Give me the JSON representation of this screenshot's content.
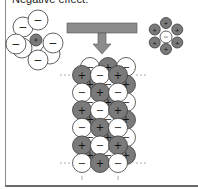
{
  "caption": "Negative effect:",
  "colors": {
    "cation_fill": "#7a7a7a",
    "anion_fill": "#ffffff",
    "outline": "#3a3a3a",
    "arrow_fill": "#8c8c8c",
    "border": "#8a8a8a"
  },
  "symbols": {
    "cation": "+",
    "anion": "−"
  },
  "left_cluster": {
    "label": "hydrated cation",
    "center": "cation",
    "surrounding": [
      "anion",
      "anion",
      "anion",
      "anion",
      "anion"
    ]
  },
  "right_cluster": {
    "label": "hydrated anion",
    "center": "anion",
    "surrounding": [
      "cation",
      "cation",
      "cation",
      "cation",
      "cation",
      "cation"
    ]
  },
  "arrow": {
    "direction": "down",
    "label": ""
  },
  "lattice": {
    "label": "ionic crystal lattice",
    "rows": [
      [
        "cation",
        "anion",
        "cation"
      ],
      [
        "anion",
        "cation",
        "anion"
      ],
      [
        "cation",
        "anion",
        "cation"
      ],
      [
        "anion",
        "cation",
        "anion"
      ],
      [
        "cation",
        "anion",
        "cation"
      ],
      [
        "anion",
        "cation",
        "anion"
      ]
    ]
  }
}
